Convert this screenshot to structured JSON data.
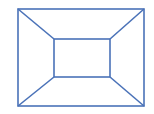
{
  "diagram": {
    "stroke_color": "#4a72b8",
    "background": "#ffffff",
    "outer_rect": {
      "x1": 18,
      "y1": 9,
      "x2": 144,
      "y2": 106
    },
    "inner_rect": {
      "x1": 54,
      "y1": 39,
      "x2": 110,
      "y2": 77
    }
  }
}
